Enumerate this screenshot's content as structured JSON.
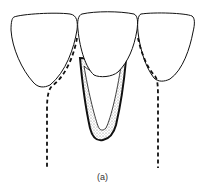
{
  "figure": {
    "caption": "(a)",
    "elements": [
      "left-tooth-crown",
      "center-tooth-crown",
      "right-tooth-crown",
      "center-root-socket",
      "left-root-outline-dashed",
      "right-root-outline-dashed"
    ],
    "colors": {
      "line": "#111111",
      "stipple": "#888888",
      "background": "#ffffff"
    }
  }
}
